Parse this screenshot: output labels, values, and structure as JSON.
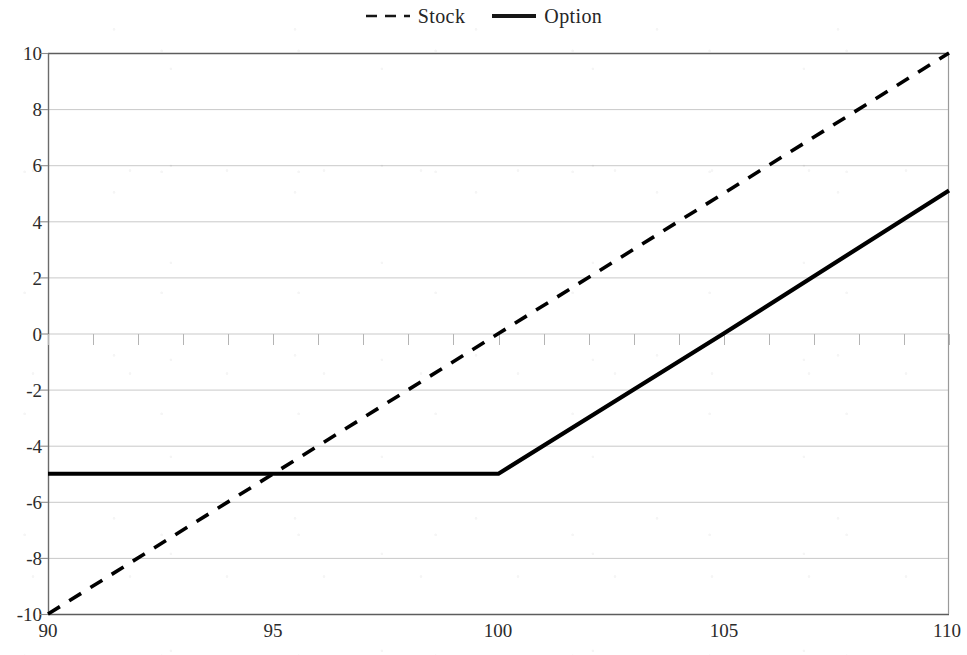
{
  "chart_data": {
    "type": "line",
    "title": "",
    "subtitle": "",
    "xlabel": "",
    "ylabel": "",
    "xlim": [
      90,
      110
    ],
    "ylim": [
      -10,
      10
    ],
    "xticks": [
      90,
      95,
      100,
      105,
      110
    ],
    "yticks": [
      10,
      8,
      6,
      4,
      2,
      0,
      -2,
      -4,
      -6,
      -8,
      -10
    ],
    "x_minor_tick_step": 1,
    "grid": "horizontal",
    "grid_color": "#c9c9c9",
    "legend_position": "top-center",
    "series": [
      {
        "name": "Stock",
        "style": "dashed",
        "color": "#000000",
        "points": [
          {
            "x": 90,
            "y": -10
          },
          {
            "x": 95,
            "y": -5
          },
          {
            "x": 100,
            "y": 0
          },
          {
            "x": 105,
            "y": 5
          },
          {
            "x": 110,
            "y": 10
          }
        ]
      },
      {
        "name": "Option",
        "style": "solid",
        "color": "#000000",
        "points": [
          {
            "x": 90,
            "y": -5
          },
          {
            "x": 95,
            "y": -5
          },
          {
            "x": 100,
            "y": -5
          },
          {
            "x": 105,
            "y": 0
          },
          {
            "x": 110,
            "y": 5.1
          }
        ]
      }
    ]
  },
  "legend": {
    "entries": [
      {
        "label": "Stock",
        "icon": "dashed-line-icon"
      },
      {
        "label": "Option",
        "icon": "solid-line-icon"
      }
    ]
  },
  "axes": {
    "x_tick_labels": [
      "90",
      "95",
      "100",
      "105",
      "110"
    ],
    "y_tick_labels": [
      "10",
      "8",
      "6",
      "4",
      "2",
      "0",
      "-2",
      "-4",
      "-6",
      "-8",
      "-10"
    ]
  }
}
